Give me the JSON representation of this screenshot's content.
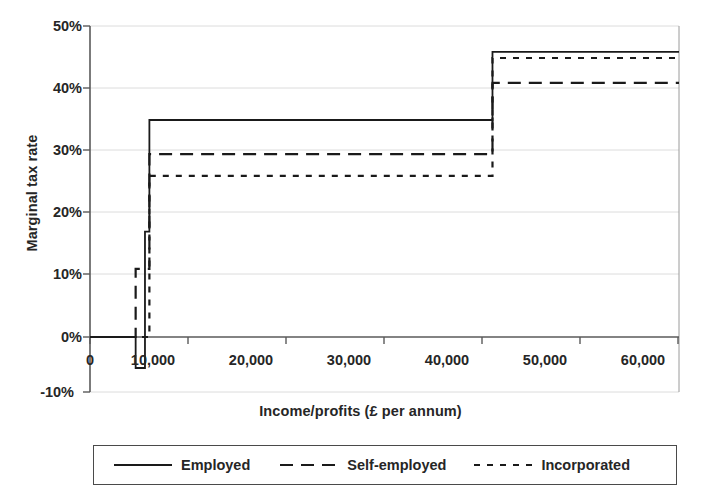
{
  "chart_data": {
    "type": "line",
    "title": "",
    "xlabel": "Income/profits (£ per annum)",
    "ylabel": "Marginal tax rate",
    "xlim": [
      0,
      60000
    ],
    "ylim": [
      -10,
      50
    ],
    "xticks": [
      0,
      10000,
      20000,
      30000,
      40000,
      50000,
      60000
    ],
    "xtick_labels": [
      "0",
      "10,000",
      "20,000",
      "30,000",
      "40,000",
      "50,000",
      "60,000"
    ],
    "yticks": [
      -10,
      0,
      10,
      20,
      30,
      40,
      50
    ],
    "ytick_labels": [
      "-10%",
      "0%",
      "10%",
      "20%",
      "30%",
      "40%",
      "50%"
    ],
    "grid": true,
    "legend_position": "below",
    "series": [
      {
        "name": "Employed",
        "style": "solid",
        "color": "#1a1a1a",
        "steps": [
          {
            "x_from": 0,
            "x_to": 4650,
            "y": 0
          },
          {
            "x_from": 4650,
            "x_to": 5600,
            "y": -5
          },
          {
            "x_from": 5600,
            "x_to": 6050,
            "y": 17
          },
          {
            "x_from": 6050,
            "x_to": 41000,
            "y": 35
          },
          {
            "x_from": 41000,
            "x_to": 60000,
            "y": 46
          }
        ]
      },
      {
        "name": "Self-employed",
        "style": "long-dash",
        "color": "#1a1a1a",
        "steps": [
          {
            "x_from": 0,
            "x_to": 4650,
            "y": 0
          },
          {
            "x_from": 4650,
            "x_to": 6050,
            "y": 11
          },
          {
            "x_from": 6050,
            "x_to": 41000,
            "y": 29.5
          },
          {
            "x_from": 41000,
            "x_to": 60000,
            "y": 41
          }
        ]
      },
      {
        "name": "Incorporated",
        "style": "short-dash",
        "color": "#1a1a1a",
        "steps": [
          {
            "x_from": 0,
            "x_to": 6050,
            "y": 0
          },
          {
            "x_from": 6050,
            "x_to": 41000,
            "y": 26
          },
          {
            "x_from": 41000,
            "x_to": 60000,
            "y": 45
          }
        ]
      }
    ],
    "annotations": {
      "threshold_low": 5600,
      "threshold_mid": 6050,
      "threshold_high": 41000
    }
  },
  "axes": {
    "y_title": "Marginal tax rate",
    "x_title": "Income/profits (£ per annum)",
    "y_labels": [
      "50%",
      "40%",
      "30%",
      "20%",
      "10%",
      "0%",
      "-10%"
    ],
    "x_labels": [
      "0",
      "10,000",
      "20,000",
      "30,000",
      "40,000",
      "50,000",
      "60,000"
    ]
  },
  "legend": {
    "entries": [
      {
        "label": "Employed",
        "style": "solid"
      },
      {
        "label": "Self-employed",
        "style": "long-dash"
      },
      {
        "label": "Incorporated",
        "style": "short-dash"
      }
    ]
  },
  "colors": {
    "line": "#1a1a1a",
    "grid": "#d9d9d9",
    "axis": "#4a4a4a",
    "text": "#262626",
    "background": "#ffffff"
  }
}
